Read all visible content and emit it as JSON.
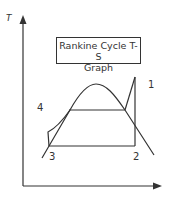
{
  "title": {
    "line1": "Rankine Cycle T-S",
    "line2": "Graph"
  },
  "axes": {
    "y_label": "T",
    "x_label": ""
  },
  "points": {
    "p1": {
      "label": "1"
    },
    "p2": {
      "label": "2"
    },
    "p3": {
      "label": "3"
    },
    "p4": {
      "label": "4"
    }
  },
  "colors": {
    "line": "#333333",
    "background": "#ffffff"
  }
}
